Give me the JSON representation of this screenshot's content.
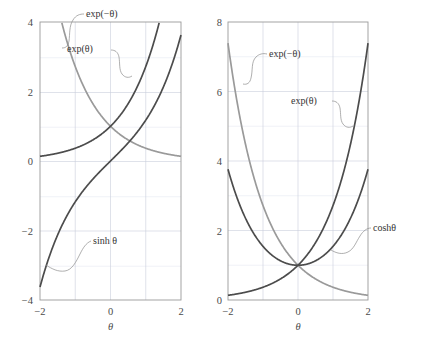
{
  "figure": {
    "background": "#ffffff",
    "colors": {
      "curve_dark": "#4c4c4c",
      "curve_light": "#9a9a9a",
      "grid_major": "#c9cfdb",
      "grid_minor": "#e6eaf1",
      "frame": "#9a9a9a",
      "text": "#3a3a3a"
    }
  },
  "chart_data": [
    {
      "id": "left-panel",
      "type": "line",
      "title": "",
      "xlabel": "θ",
      "ylabel": "",
      "xlim": [
        -2,
        2
      ],
      "ylim": [
        -4,
        4
      ],
      "grid": true,
      "legend_position": "inline-annotations",
      "xticks": [
        -2,
        0,
        2
      ],
      "xtick_labels": [
        "−2",
        "0",
        "2"
      ],
      "yticks": [
        -4,
        -2,
        0,
        2,
        4
      ],
      "ytick_labels": [
        "−4",
        "−2",
        "0",
        "2",
        "4"
      ],
      "xminor": [
        -1,
        1
      ],
      "yminor": [
        -3,
        -1,
        1,
        3
      ],
      "series": [
        {
          "name": "exp(θ)",
          "label": "exp(θ)",
          "color": "#4c4c4c",
          "x": [
            -2.0,
            -1.5,
            -1.0,
            -0.5,
            0.0,
            0.5,
            1.0,
            1.25,
            1.386
          ],
          "values": [
            0.135,
            0.223,
            0.368,
            0.607,
            1.0,
            1.649,
            2.718,
            3.49,
            4.0
          ]
        },
        {
          "name": "exp(−θ)",
          "label": "exp(−θ)",
          "color": "#9a9a9a",
          "x": [
            -1.386,
            -1.25,
            -1.0,
            -0.5,
            0.0,
            0.5,
            1.0,
            1.5,
            2.0
          ],
          "values": [
            4.0,
            3.49,
            2.718,
            1.649,
            1.0,
            0.607,
            0.368,
            0.223,
            0.135
          ]
        },
        {
          "name": "sinh θ",
          "label": "sinh θ",
          "color": "#4c4c4c",
          "x": [
            -2.0,
            -1.5,
            -1.0,
            -0.5,
            0.0,
            0.5,
            1.0,
            1.5,
            2.0
          ],
          "values": [
            -3.627,
            -2.129,
            -1.175,
            -0.521,
            0.0,
            0.521,
            1.175,
            2.129,
            3.627
          ]
        }
      ],
      "annotations": [
        {
          "text": "exp(−θ)",
          "target_series": "exp(−θ)"
        },
        {
          "text": "exp(θ)",
          "target_series": "exp(θ)"
        },
        {
          "text": "sinh θ",
          "target_series": "sinh θ"
        }
      ]
    },
    {
      "id": "right-panel",
      "type": "line",
      "title": "",
      "xlabel": "θ",
      "ylabel": "",
      "xlim": [
        -2,
        2
      ],
      "ylim": [
        0,
        8
      ],
      "grid": true,
      "legend_position": "inline-annotations",
      "xticks": [
        -2,
        0,
        2
      ],
      "xtick_labels": [
        "−2",
        "0",
        "2"
      ],
      "yticks": [
        0,
        2,
        4,
        6,
        8
      ],
      "ytick_labels": [
        "0",
        "2",
        "4",
        "6",
        "8"
      ],
      "xminor": [
        -1,
        1
      ],
      "yminor": [
        1,
        3,
        5,
        7
      ],
      "series": [
        {
          "name": "exp(−θ)",
          "label": "exp(−θ)",
          "color": "#9a9a9a",
          "x": [
            -2.0,
            -1.5,
            -1.0,
            -0.5,
            0.0,
            0.5,
            1.0,
            1.5,
            2.0
          ],
          "values": [
            7.389,
            4.482,
            2.718,
            1.649,
            1.0,
            0.607,
            0.368,
            0.223,
            0.135
          ]
        },
        {
          "name": "exp(θ)",
          "label": "exp(θ)",
          "color": "#4c4c4c",
          "x": [
            -2.0,
            -1.5,
            -1.0,
            -0.5,
            0.0,
            0.5,
            1.0,
            1.5,
            2.0
          ],
          "values": [
            0.135,
            0.223,
            0.368,
            0.607,
            1.0,
            1.649,
            2.718,
            4.482,
            7.389
          ]
        },
        {
          "name": "coshθ",
          "label": "coshθ",
          "color": "#4c4c4c",
          "x": [
            -2.0,
            -1.5,
            -1.0,
            -0.5,
            0.0,
            0.5,
            1.0,
            1.5,
            2.0
          ],
          "values": [
            3.762,
            2.352,
            1.543,
            1.128,
            1.0,
            1.128,
            1.543,
            2.352,
            3.762
          ]
        }
      ],
      "annotations": [
        {
          "text": "exp(−θ)",
          "target_series": "exp(−θ)"
        },
        {
          "text": "exp(θ)",
          "target_series": "exp(θ)"
        },
        {
          "text": "coshθ",
          "target_series": "coshθ"
        }
      ]
    }
  ],
  "left": {
    "yticks": [
      "4",
      "2",
      "0",
      "−2",
      "−4"
    ],
    "xticks": [
      "−2",
      "0",
      "2"
    ],
    "axis_label": "θ",
    "labels": {
      "exp_neg": "exp(−θ)",
      "exp_pos": "exp(θ)",
      "sinh": "sinh θ"
    }
  },
  "right": {
    "yticks": [
      "8",
      "6",
      "4",
      "2",
      "0"
    ],
    "xticks": [
      "−2",
      "0",
      "2"
    ],
    "axis_label": "θ",
    "labels": {
      "exp_neg": "exp(−θ)",
      "exp_pos": "exp(θ)",
      "cosh": "coshθ"
    }
  }
}
